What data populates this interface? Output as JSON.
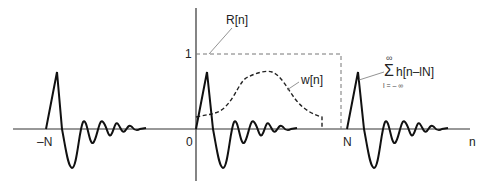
{
  "diagram": {
    "type": "signal-plot",
    "axis": {
      "x_label": "n"
    },
    "tick_labels": {
      "neg_N": "–N",
      "zero": "0",
      "N": "N",
      "one": "1"
    },
    "curves": {
      "rect_window": {
        "label": "R[n]",
        "style": "dashed-thin"
      },
      "window": {
        "label": "w[n]",
        "style": "dashed"
      },
      "periodic_sum": {
        "sigma": "Σ",
        "upper": "∞",
        "body": "h[n–lN]",
        "lower": "l = – ∞",
        "style": "solid"
      }
    }
  }
}
